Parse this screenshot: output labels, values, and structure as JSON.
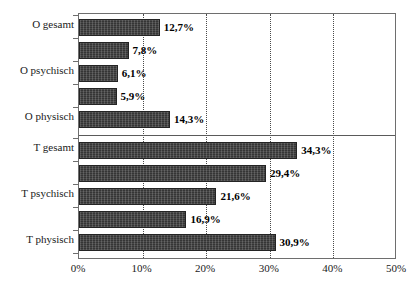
{
  "chart_data": {
    "type": "bar",
    "orientation": "horizontal",
    "title": "",
    "xlabel": "",
    "ylabel": "",
    "xlim": [
      0,
      50
    ],
    "xticks": [
      "0%",
      "10%",
      "20%",
      "30%",
      "40%",
      "50%"
    ],
    "xtick_values": [
      0,
      10,
      20,
      30,
      40,
      50
    ],
    "grid": "vertical-dotted",
    "legend": "none",
    "bar_color": "#3b3b3b",
    "group_separator": true,
    "categories": [
      "O gesamt",
      "",
      "O psychisch",
      "",
      "O physisch",
      "T gesamt",
      "",
      "T psychisch",
      "",
      "T physisch"
    ],
    "values": [
      12.7,
      7.8,
      6.1,
      5.9,
      14.3,
      34.3,
      29.4,
      21.6,
      16.9,
      30.9
    ],
    "value_labels": [
      "12,7%",
      "7,8%",
      "6,1%",
      "5,9%",
      "14,3%",
      "34,3%",
      "29,4%",
      "21,6%",
      "16,9%",
      "30,9%"
    ],
    "axis_tick_labels": [
      "O gesamt",
      "O psychisch",
      "O physisch",
      "T gesamt",
      "T psychisch",
      "T physisch"
    ]
  },
  "axis_labels": {
    "visible_categories": [
      {
        "text": "O gesamt",
        "top": 18
      },
      {
        "text": "O psychisch",
        "top": 64
      },
      {
        "text": "O physisch",
        "top": 110
      },
      {
        "text": "T gesamt",
        "top": 141
      },
      {
        "text": "T psychisch",
        "top": 187
      },
      {
        "text": "T physisch",
        "top": 233
      }
    ]
  },
  "title_strip": {
    "text": ""
  }
}
